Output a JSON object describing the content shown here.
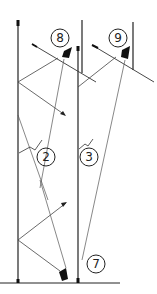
{
  "diagram": {
    "colors": {
      "line": "#222222",
      "thin_line": "#555555",
      "background": "#ffffff"
    },
    "labels": [
      {
        "id": "8",
        "text": "8",
        "x": 60,
        "y": 38
      },
      {
        "id": "9",
        "text": "9",
        "x": 118,
        "y": 38
      },
      {
        "id": "2",
        "text": "2",
        "x": 46,
        "y": 157
      },
      {
        "id": "3",
        "text": "3",
        "x": 89,
        "y": 157
      },
      {
        "id": "7",
        "text": "7",
        "x": 96,
        "y": 264
      }
    ]
  }
}
